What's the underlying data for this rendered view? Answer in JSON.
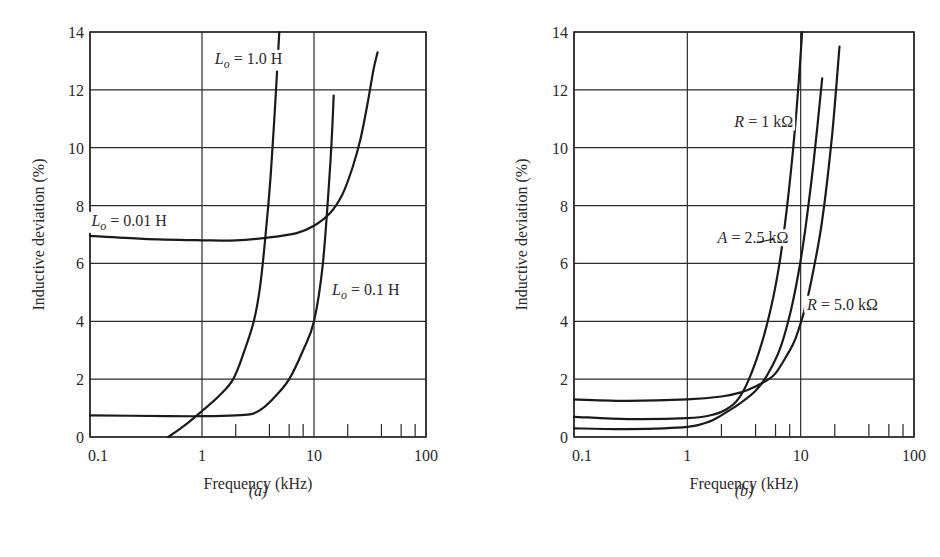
{
  "figure": {
    "panels": [
      {
        "id": "a",
        "caption": "(a)",
        "title": "",
        "xlabel": "Frequency (kHz)",
        "ylabel": "Inductive deviation (%)",
        "x_tick_labels": [
          "0.1",
          "1",
          "10",
          "100"
        ],
        "y_tick_labels": [
          "0",
          "2",
          "4",
          "6",
          "8",
          "10",
          "12",
          "14"
        ],
        "annotations": [
          {
            "text_main": "L",
            "text_sub": "o",
            "text_rest": " = 1.0 H",
            "x": 1.3,
            "y": 12.9
          },
          {
            "text_main": "L",
            "text_sub": "o",
            "text_rest": " = 0.01 H",
            "x": 0.103,
            "y": 7.3
          },
          {
            "text_main": "L",
            "text_sub": "o",
            "text_rest": " = 0.1 H",
            "x": 14.5,
            "y": 4.9
          }
        ]
      },
      {
        "id": "b",
        "caption": "(b)",
        "title": "",
        "xlabel": "Frequency (kHz)",
        "ylabel": "Inductive deviation (%)",
        "x_tick_labels": [
          "0.1",
          "1",
          "10",
          "100"
        ],
        "y_tick_labels": [
          "0",
          "2",
          "4",
          "6",
          "8",
          "10",
          "12",
          "14"
        ],
        "annotations": [
          {
            "text_main": "R",
            "text_sub": "",
            "text_rest": " = 1 kΩ",
            "x": 2.6,
            "y": 10.7
          },
          {
            "text_main": "A",
            "text_sub": "",
            "text_rest": " = 2.5 kΩ",
            "x": 1.85,
            "y": 6.7
          },
          {
            "text_main": "R",
            "text_sub": "",
            "text_rest": " = 5.0 kΩ",
            "x": 11.4,
            "y": 4.4
          }
        ]
      }
    ]
  },
  "chart_data": [
    {
      "type": "line",
      "panel": "(a)",
      "title": "",
      "xlabel": "Frequency (kHz)",
      "ylabel": "Inductive deviation (%)",
      "xscale": "log",
      "xlim": [
        0.1,
        100
      ],
      "ylim": [
        0,
        14
      ],
      "x_ticks": [
        0.1,
        1,
        10,
        100
      ],
      "x_minor_ticks": [
        2,
        4,
        6,
        8,
        20,
        40,
        60,
        80
      ],
      "y_ticks": [
        0,
        2,
        4,
        6,
        8,
        10,
        12,
        14
      ],
      "grid": true,
      "legend": "inline annotations",
      "series": [
        {
          "name": "Lo = 1.0 H",
          "x": [
            0.5,
            0.7,
            1.0,
            1.4,
            1.9,
            2.4,
            2.9,
            3.3,
            3.7,
            4.1,
            4.5,
            4.9
          ],
          "y": [
            0.0,
            0.4,
            0.9,
            1.4,
            2.0,
            3.0,
            4.0,
            5.2,
            7.0,
            9.0,
            11.5,
            14.0
          ]
        },
        {
          "name": "Lo = 0.01 H",
          "x": [
            0.1,
            0.3,
            1.0,
            2.0,
            4.0,
            7.0,
            10.0,
            14.0,
            18.0,
            22.0,
            26.0,
            30.0,
            34.0,
            37.0
          ],
          "y": [
            6.95,
            6.85,
            6.8,
            6.8,
            6.9,
            7.05,
            7.3,
            7.75,
            8.4,
            9.3,
            10.3,
            11.5,
            12.7,
            13.3
          ]
        },
        {
          "name": "Lo = 0.1 H",
          "x": [
            0.1,
            0.5,
            1.0,
            2.0,
            2.8,
            3.5,
            4.5,
            6.0,
            8.0,
            10.0,
            12.0,
            14.0,
            15.0
          ],
          "y": [
            0.75,
            0.72,
            0.72,
            0.75,
            0.8,
            1.0,
            1.4,
            2.0,
            3.0,
            4.0,
            6.0,
            9.5,
            11.8
          ]
        }
      ]
    },
    {
      "type": "line",
      "panel": "(b)",
      "title": "",
      "xlabel": "Frequency (kHz)",
      "ylabel": "Inductive deviation (%)",
      "xscale": "log",
      "xlim": [
        0.1,
        100
      ],
      "ylim": [
        0,
        14
      ],
      "x_ticks": [
        0.1,
        1,
        10,
        100
      ],
      "x_minor_ticks": [
        2,
        4,
        6,
        8,
        20,
        40,
        60,
        80
      ],
      "y_ticks": [
        0,
        2,
        4,
        6,
        8,
        10,
        12,
        14
      ],
      "grid": true,
      "legend": "inline annotations",
      "series": [
        {
          "name": "R = 1 kΩ",
          "x": [
            0.1,
            0.3,
            1.0,
            1.6,
            2.2,
            2.8,
            3.5,
            4.5,
            5.5,
            6.5,
            7.5,
            8.5,
            9.5,
            10.3
          ],
          "y": [
            0.7,
            0.62,
            0.65,
            0.75,
            0.95,
            1.3,
            2.0,
            3.2,
            4.5,
            6.0,
            7.8,
            9.8,
            12.0,
            14.0
          ]
        },
        {
          "name": "A = 2.5 kΩ",
          "x": [
            0.1,
            0.3,
            1.0,
            1.6,
            2.2,
            3.0,
            4.0,
            5.0,
            6.5,
            8.0,
            9.5,
            11.0,
            13.0,
            15.5
          ],
          "y": [
            0.3,
            0.27,
            0.35,
            0.55,
            0.85,
            1.2,
            1.6,
            2.1,
            3.0,
            4.2,
            5.6,
            7.2,
            9.5,
            12.4
          ]
        },
        {
          "name": "R = 5.0 kΩ",
          "x": [
            0.1,
            0.3,
            1.0,
            2.0,
            3.0,
            4.0,
            5.0,
            6.0,
            7.5,
            9.0,
            11.0,
            13.0,
            15.5,
            19.0,
            22.0
          ],
          "y": [
            1.3,
            1.25,
            1.3,
            1.4,
            1.55,
            1.75,
            1.95,
            2.2,
            2.8,
            3.4,
            4.5,
            5.8,
            7.5,
            10.5,
            13.5
          ]
        }
      ]
    }
  ]
}
